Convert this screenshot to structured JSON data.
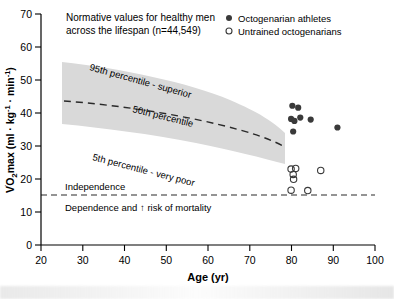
{
  "chart_data": {
    "type": "scatter",
    "title": "",
    "xlabel": "Age (yr)",
    "ylabel": "V̇O₂max (ml · kg⁻¹ · min⁻¹)",
    "xlim": [
      20,
      100
    ],
    "ylim": [
      0,
      70
    ],
    "xticks": [
      20,
      30,
      40,
      50,
      60,
      70,
      80,
      90,
      100
    ],
    "yticks": [
      0,
      10,
      20,
      30,
      40,
      50,
      60,
      70
    ],
    "grid": false,
    "legend_position": "top-right",
    "legend": [
      {
        "key": "octogenarian-athletes",
        "label": "Octogenarian athletes",
        "marker": "filled-circle",
        "color": "#3a3a3a"
      },
      {
        "key": "untrained-octogenarians",
        "label": "Untrained octogenarians",
        "marker": "open-circle",
        "color": "#3a3a3a"
      }
    ],
    "annotations": [
      {
        "key": "chart-caption-line1",
        "text": "Normative values for healthy men"
      },
      {
        "key": "chart-caption-line2",
        "text": "across the lifespan (n=44,549)"
      },
      {
        "key": "band-upper-label",
        "text": "95th percentile - superior"
      },
      {
        "key": "band-median-label",
        "text": "50th percentile"
      },
      {
        "key": "band-lower-label",
        "text": "5th percentile - very poor"
      },
      {
        "key": "independence-label",
        "text": "Independence"
      },
      {
        "key": "dependence-label",
        "text": "Dependence and ↑ risk of mortality"
      }
    ],
    "threshold_line": {
      "label": "independence-threshold",
      "y": 15,
      "style": "dashed"
    },
    "normative_band": {
      "x_range": [
        25,
        78
      ],
      "p95": [
        [
          25,
          55.5
        ],
        [
          40,
          52.5
        ],
        [
          55,
          47.5
        ],
        [
          65,
          43.0
        ],
        [
          78,
          37.5
        ]
      ],
      "p50": [
        [
          25,
          43.5
        ],
        [
          40,
          40.5
        ],
        [
          55,
          36.5
        ],
        [
          65,
          33.0
        ],
        [
          78,
          29.0
        ]
      ],
      "p5": [
        [
          25,
          32.5
        ],
        [
          40,
          31.0
        ],
        [
          55,
          29.0
        ],
        [
          65,
          27.5
        ],
        [
          78,
          24.5
        ]
      ],
      "fill_color": "#d8d8d8"
    },
    "series": [
      {
        "name": "Octogenarian athletes",
        "marker": "filled-circle",
        "points": [
          [
            80.2,
            42.2
          ],
          [
            81.6,
            41.6
          ],
          [
            79.9,
            38.2
          ],
          [
            80.7,
            37.6
          ],
          [
            82.1,
            38.6
          ],
          [
            80.4,
            34.4
          ],
          [
            84.6,
            38.0
          ],
          [
            91.0,
            35.6
          ]
        ]
      },
      {
        "name": "Untrained octogenarians",
        "marker": "open-circle",
        "points": [
          [
            79.9,
            23.0
          ],
          [
            81.0,
            23.2
          ],
          [
            80.4,
            21.4
          ],
          [
            80.5,
            19.9
          ],
          [
            79.9,
            16.6
          ],
          [
            83.9,
            16.5
          ],
          [
            87.0,
            22.6
          ]
        ]
      }
    ]
  }
}
